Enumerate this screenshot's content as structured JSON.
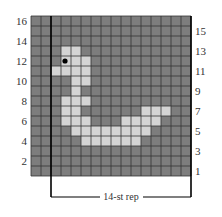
{
  "chart": {
    "title": "",
    "columns": 16,
    "rows": 16,
    "colors": {
      "background": "#ffffff",
      "main": "#7d7d7d",
      "contrast": "#d4d4d4",
      "gridline": "#333333",
      "bead": "#000000",
      "text": "#333333"
    },
    "left_row_labels": [
      "16",
      "14",
      "12",
      "10",
      "8",
      "6",
      "4",
      "2"
    ],
    "right_row_labels": [
      "15",
      "13",
      "11",
      "9",
      "7",
      "5",
      "3",
      "1"
    ],
    "repeat_label": "14-st rep",
    "repeat_columns": 14,
    "repeat_start_column": 2,
    "contrast_cells": [
      {
        "row": 13,
        "cols": [
          3,
          4
        ]
      },
      {
        "row": 12,
        "cols": [
          3,
          4,
          5
        ]
      },
      {
        "row": 11,
        "cols": [
          2,
          3,
          4,
          5
        ]
      },
      {
        "row": 10,
        "cols": [
          4,
          5
        ]
      },
      {
        "row": 9,
        "cols": [
          4
        ]
      },
      {
        "row": 8,
        "cols": [
          3,
          4,
          5
        ]
      },
      {
        "row": 7,
        "cols": [
          3,
          4,
          11,
          12,
          13
        ]
      },
      {
        "row": 6,
        "cols": [
          3,
          4,
          5,
          9,
          10,
          11,
          12
        ]
      },
      {
        "row": 5,
        "cols": [
          4,
          5,
          6,
          7,
          8,
          9,
          10,
          11
        ]
      },
      {
        "row": 4,
        "cols": [
          5,
          6,
          7,
          8,
          9,
          10
        ]
      }
    ],
    "eye": {
      "row": 12,
      "col": 3
    }
  }
}
